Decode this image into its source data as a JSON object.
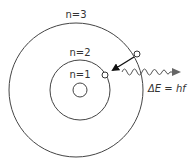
{
  "diagram": {
    "colors": {
      "stroke": "#444444",
      "arrow": "#111111",
      "photon": "#555555",
      "photon_arrow": "#666666",
      "text": "#333333"
    },
    "orbits": [
      {
        "label": "n=1",
        "cx": 80,
        "cy": 90,
        "r": 7
      },
      {
        "label": "n=2",
        "cx": 80,
        "cy": 90,
        "r": 30
      },
      {
        "label": "n=3",
        "cx": 76,
        "cy": 90,
        "r": 67
      }
    ],
    "labels": {
      "n1": "n=1",
      "n2": "n=2",
      "n3": "n=3",
      "equation": "ΔE = hf"
    },
    "electrons": [
      {
        "name": "electron-initial",
        "orbit": "n=3",
        "cx": 137,
        "cy": 54
      },
      {
        "name": "electron-final",
        "orbit": "n=2",
        "cx": 105,
        "cy": 75
      }
    ],
    "transition": {
      "from": "n=3",
      "to": "n=2"
    },
    "photon": {
      "label": "ΔE = hf",
      "direction": "right"
    }
  }
}
